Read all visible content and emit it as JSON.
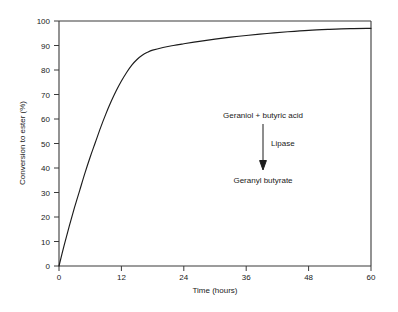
{
  "chart_data": {
    "type": "line",
    "title": "",
    "subtitle": "",
    "xlabel": "Time (hours)",
    "ylabel": "Conversion to ester (%)",
    "xlim": [
      0,
      60
    ],
    "ylim": [
      0,
      100
    ],
    "grid": false,
    "legend": "none",
    "xticks": [
      "0",
      "12",
      "24",
      "36",
      "48",
      "60"
    ],
    "xtick_values": [
      0,
      12,
      24,
      36,
      48,
      60
    ],
    "yticks": [
      "0",
      "10",
      "20",
      "30",
      "40",
      "50",
      "60",
      "70",
      "80",
      "90",
      "100"
    ],
    "ytick_values": [
      0,
      10,
      20,
      30,
      40,
      50,
      60,
      70,
      80,
      90,
      100
    ],
    "series": [
      {
        "name": "Conversion to geranyl butyrate",
        "x": [
          0,
          1,
          2,
          3,
          4,
          5,
          6,
          7,
          8,
          9,
          10,
          11,
          12,
          13,
          14,
          15,
          16,
          17,
          18,
          20,
          22,
          24,
          27,
          30,
          33,
          36,
          40,
          44,
          48,
          52,
          56,
          60
        ],
        "values": [
          0,
          8.5,
          16.5,
          24.0,
          31.0,
          38.0,
          44.5,
          50.5,
          56.5,
          62.0,
          67.0,
          71.5,
          75.5,
          79.0,
          82.0,
          84.3,
          86.0,
          87.2,
          88.1,
          89.2,
          90.0,
          90.7,
          91.7,
          92.6,
          93.4,
          94.1,
          94.9,
          95.6,
          96.2,
          96.6,
          96.9,
          97.0
        ]
      }
    ],
    "annotations": {
      "reactants": "Geraniol + butyric acid",
      "catalyst": "Lipase",
      "product": "Geranyl butyrate"
    },
    "colors": {
      "curve": "#1c1c1c",
      "axis": "#3a3a3a",
      "text": "#1a1a1a",
      "background": "#ffffff"
    }
  }
}
